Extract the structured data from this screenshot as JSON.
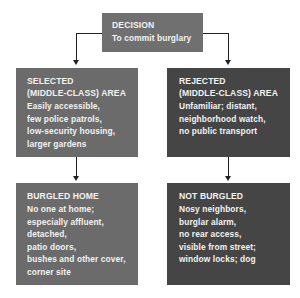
{
  "decision": {
    "title": "DECISION",
    "lines": [
      "To commit burglary"
    ]
  },
  "selected_area": {
    "title_lines": [
      "SELECTED",
      "(MIDDLE-CLASS) AREA"
    ],
    "lines": [
      "Easily accessible,",
      "few police patrols,",
      "low-security housing,",
      "larger gardens"
    ]
  },
  "rejected_area": {
    "title_lines": [
      "REJECTED",
      "(MIDDLE-CLASS) AREA"
    ],
    "lines": [
      "Unfamiliar; distant,",
      "neighborhood watch,",
      "no public transport"
    ]
  },
  "burgled_home": {
    "title": "BURGLED HOME",
    "lines": [
      "No one at home;",
      "especially affluent,",
      "detached,",
      "patio doors,",
      "bushes and other cover,",
      "corner site"
    ]
  },
  "not_burgled": {
    "title": "NOT BURGLED",
    "lines": [
      "Nosy neighbors,",
      "burglar alarm,",
      "no rear access,",
      "visible from street;",
      "window locks; dog"
    ]
  },
  "colors": {
    "selected_box": "#6b6b6b",
    "rejected_box": "#454545",
    "decision_box": "#707070",
    "text": "#f2f2f2",
    "connector": "#222222"
  }
}
